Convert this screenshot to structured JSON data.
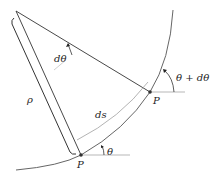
{
  "labels": {
    "dtheta": "dθ",
    "rho": "ρ",
    "ds": "ds",
    "P_upper": "P",
    "P_lower": "P",
    "theta": "θ",
    "theta_plus_dtheta": "θ + dθ"
  },
  "colors": {
    "line": "#333333",
    "curve": "#555555",
    "arc_ds": "#aaaaaa"
  }
}
